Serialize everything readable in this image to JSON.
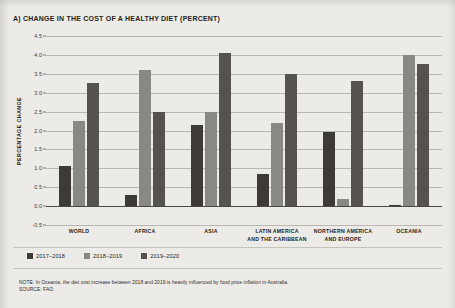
{
  "chart_title": "A) CHANGE IN THE COST OF A HEALTHY DIET (PERCENT)",
  "axes": {
    "y_title": "PERCENTAGE CHANGE",
    "y_ticks": [
      "4.5",
      "4.0",
      "3.5",
      "3.0",
      "2.5",
      "2.0",
      "1.5",
      "1.0",
      "0.5",
      "0.0",
      "-0.5"
    ]
  },
  "legend": {
    "items": [
      {
        "label": "2017–2018",
        "color": "#3d3a38"
      },
      {
        "label": "2018–2019",
        "color": "#8a8884"
      },
      {
        "label": "2019–2020",
        "color": "#55524f"
      }
    ]
  },
  "footnotes": {
    "note": "NOTE: In Oceania, the diet cost increase between 2018 and 2019 is heavily influenced by food price inflation in Australia.",
    "source": "SOURCE: FAO."
  },
  "chart_data": {
    "type": "bar",
    "title": "A) CHANGE IN THE COST OF A HEALTHY DIET (PERCENT)",
    "xlabel": "",
    "ylabel": "PERCENTAGE CHANGE",
    "ylim": [
      -0.5,
      4.5
    ],
    "ytick_step": 0.5,
    "grid": true,
    "legend_position": "bottom-left",
    "categories": [
      "WORLD",
      "AFRICA",
      "ASIA",
      "LATIN AMERICA AND THE CARIBBEAN",
      "NORTHERN AMERICA AND EUROPE",
      "OCEANIA"
    ],
    "category_labels": [
      [
        "WORLD"
      ],
      [
        "AFRICA"
      ],
      [
        "ASIA"
      ],
      [
        "LATIN AMERICA",
        "AND THE CARIBBEAN"
      ],
      [
        "NORTHERN AMERICA",
        "AND EUROPE"
      ],
      [
        "OCEANIA"
      ]
    ],
    "series": [
      {
        "name": "2017–2018",
        "color": "#3d3a38",
        "values": [
          1.05,
          0.3,
          2.15,
          0.85,
          1.95,
          0.02
        ]
      },
      {
        "name": "2018–2019",
        "color": "#8a8884",
        "values": [
          2.25,
          3.6,
          2.5,
          2.2,
          0.2,
          4.0
        ]
      },
      {
        "name": "2019–2020",
        "color": "#55524f",
        "values": [
          3.25,
          2.5,
          4.05,
          3.5,
          3.3,
          3.75
        ]
      }
    ]
  }
}
